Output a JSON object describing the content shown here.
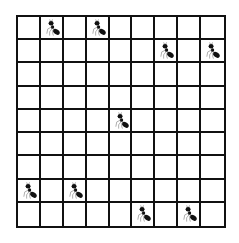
{
  "board": {
    "rows": 9,
    "cols": 9,
    "line_color": "#111111",
    "cell_color": "#ffffff",
    "piece_icon": "ant-icon",
    "ants": [
      {
        "row": 0,
        "col": 1
      },
      {
        "row": 0,
        "col": 3
      },
      {
        "row": 1,
        "col": 6
      },
      {
        "row": 1,
        "col": 8
      },
      {
        "row": 4,
        "col": 4
      },
      {
        "row": 7,
        "col": 0
      },
      {
        "row": 7,
        "col": 2
      },
      {
        "row": 8,
        "col": 5
      },
      {
        "row": 8,
        "col": 7
      }
    ]
  }
}
